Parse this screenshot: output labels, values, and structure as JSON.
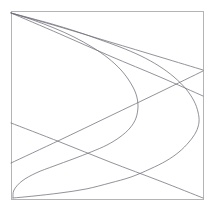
{
  "figure": {
    "title": "",
    "background_color": "#ffffff",
    "width": 213,
    "height": 211
  },
  "frame": {
    "name": "plot-border",
    "x": 11,
    "y": 11,
    "width": 192,
    "height": 188,
    "stroke_color": "#b4b4b4",
    "stroke_width": 1,
    "visible": true
  },
  "chart_data": {
    "type": "line",
    "title": "",
    "subtitle": "",
    "xlabel": "",
    "ylabel": "",
    "xlim": [
      11,
      203
    ],
    "ylim": [
      11,
      199
    ],
    "grid": false,
    "legend": "none",
    "axis_ticks": "none",
    "axis_labels_visible": false,
    "stroke_color": "#6e6e78",
    "stroke_width": 0.75,
    "series": [
      {
        "name": "curve-right-opening",
        "stroke_color": "#6e6e78",
        "stroke_width": 0.75,
        "points": [
          [
            11,
            13
          ],
          [
            30,
            18
          ],
          [
            52,
            24
          ],
          [
            75,
            31
          ],
          [
            98,
            39
          ],
          [
            120,
            47
          ],
          [
            141,
            56
          ],
          [
            159,
            66
          ],
          [
            174,
            77
          ],
          [
            186,
            89
          ],
          [
            194,
            101
          ],
          [
            198,
            112
          ],
          [
            199,
            122
          ],
          [
            196,
            132
          ],
          [
            189,
            142
          ],
          [
            179,
            152
          ],
          [
            166,
            161
          ],
          [
            150,
            169
          ],
          [
            131,
            177
          ],
          [
            110,
            183
          ],
          [
            86,
            189
          ],
          [
            60,
            193
          ],
          [
            34,
            196
          ],
          [
            13,
            198
          ]
        ]
      },
      {
        "name": "curve-left-opening",
        "stroke_color": "#6e6e78",
        "stroke_width": 0.75,
        "points": [
          [
            11,
            13
          ],
          [
            33,
            20
          ],
          [
            54,
            28
          ],
          [
            74,
            37
          ],
          [
            92,
            47
          ],
          [
            108,
            58
          ],
          [
            121,
            70
          ],
          [
            130,
            82
          ],
          [
            136,
            94
          ],
          [
            138,
            106
          ],
          [
            136,
            118
          ],
          [
            130,
            128
          ],
          [
            120,
            137
          ],
          [
            107,
            145
          ],
          [
            91,
            152
          ],
          [
            73,
            159
          ],
          [
            54,
            166
          ],
          [
            36,
            173
          ],
          [
            22,
            181
          ],
          [
            14,
            190
          ],
          [
            13,
            198
          ]
        ]
      },
      {
        "name": "chord-upper",
        "stroke_color": "#6e6e78",
        "stroke_width": 0.75,
        "points": [
          [
            11,
            13
          ],
          [
            60,
            27
          ],
          [
            110,
            42
          ],
          [
            160,
            57
          ],
          [
            203,
            70
          ]
        ]
      },
      {
        "name": "chord-lower",
        "stroke_color": "#6e6e78",
        "stroke_width": 0.75,
        "points": [
          [
            11,
            123
          ],
          [
            60,
            142
          ],
          [
            110,
            162
          ],
          [
            160,
            181
          ],
          [
            203,
            198
          ]
        ]
      },
      {
        "name": "chord-cross-a",
        "stroke_color": "#6e6e78",
        "stroke_width": 0.75,
        "points": [
          [
            11,
            163
          ],
          [
            60,
            140
          ],
          [
            110,
            116
          ],
          [
            160,
            92
          ],
          [
            203,
            71
          ]
        ]
      },
      {
        "name": "chord-cross-b",
        "stroke_color": "#6e6e78",
        "stroke_width": 0.75,
        "points": [
          [
            11,
            13
          ],
          [
            60,
            34
          ],
          [
            110,
            56
          ],
          [
            160,
            77
          ],
          [
            203,
            96
          ]
        ]
      }
    ]
  }
}
